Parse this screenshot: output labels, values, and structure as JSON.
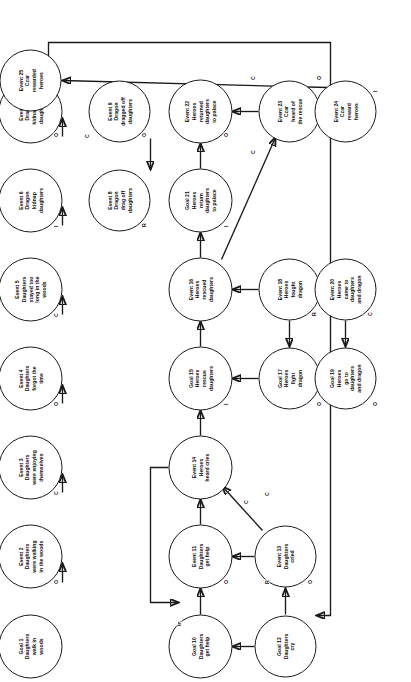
{
  "diagram": {
    "orientation": "rotated-90-ccw",
    "node_shape": "circle",
    "colors": {
      "stroke": "#1a1a1a",
      "fill": "#ffffff",
      "text": "#0d0d0d"
    },
    "edge_label_legend": {
      "O": "Outcome",
      "C": "Cause / Consequence",
      "R": "Reason",
      "I": "Initiate",
      "In": "Initiate (long-range)"
    }
  },
  "nodes": [
    {
      "id": 1,
      "label": "Goal 1\nDaughters\nwalk in\nwoods",
      "x": 36,
      "y": 30,
      "d": 64
    },
    {
      "id": 2,
      "label": "Event 2\nDaughters\nwere walking\nin the woods",
      "x": 126,
      "y": 30,
      "d": 64
    },
    {
      "id": 3,
      "label": "Event 3\nDaughters\nwere enjoying\nthemselves",
      "x": 215,
      "y": 30,
      "d": 64
    },
    {
      "id": 4,
      "label": "Event 4\nDaughters\nforgot the\ntime",
      "x": 304,
      "y": 30,
      "d": 64
    },
    {
      "id": 5,
      "label": "Event 5\nDaughters\nstayed too\nlong in the\nwoods",
      "x": 393,
      "y": 30,
      "d": 64
    },
    {
      "id": 6,
      "label": "Event 6\nDragon\nkidnap\ndaughters",
      "x": 482,
      "y": 30,
      "d": 64
    },
    {
      "id": 7,
      "label": "Event 7\nDragon\nkidnapped\ndaughters",
      "x": 571,
      "y": 30,
      "d": 64
    },
    {
      "id": 8,
      "label": "Event 8\nDragon\ndrag off\ndaughters",
      "x": 482,
      "y": 119,
      "d": 62
    },
    {
      "id": 9,
      "label": "Event 9\nDragon\ndragged off\ndaughters",
      "x": 571,
      "y": 119,
      "d": 62
    },
    {
      "id": 10,
      "label": "Goal 10\nDaughters\nget help",
      "x": 36,
      "y": 200,
      "d": 64
    },
    {
      "id": 11,
      "label": "Event 11\nDaughters\nget help",
      "x": 126,
      "y": 200,
      "d": 64
    },
    {
      "id": 12,
      "label": "Goal 12\nDaughters\ncry",
      "x": 36,
      "y": 285,
      "d": 62
    },
    {
      "id": 13,
      "label": "Event 13\nDaughters\ncried",
      "x": 126,
      "y": 285,
      "d": 62
    },
    {
      "id": 14,
      "label": "Event 14\nHeroes\nheard cries",
      "x": 215,
      "y": 200,
      "d": 64
    },
    {
      "id": 15,
      "label": "Goal 15\nHeroes\nrescue\ndaughters",
      "x": 304,
      "y": 200,
      "d": 64
    },
    {
      "id": 16,
      "label": "Event 16\nHeroes\nrescued\ndaughters",
      "x": 393,
      "y": 200,
      "d": 64
    },
    {
      "id": 17,
      "label": "Goal 17\nHeroes\nfight\ndragon",
      "x": 304,
      "y": 289,
      "d": 62
    },
    {
      "id": 18,
      "label": "Event 18\nHeroes\nfought\ndragon",
      "x": 393,
      "y": 289,
      "d": 62
    },
    {
      "id": 19,
      "label": "Goal 19\nHeroes\ngo to\ndaughters\nand dragon",
      "x": 304,
      "y": 345,
      "d": 62
    },
    {
      "id": 20,
      "label": "Event 20\nHeroes\ncame to\ndaughters\nand dragon",
      "x": 393,
      "y": 345,
      "d": 62
    },
    {
      "id": 21,
      "label": "Goal 21\nHeroes\nreturn\ndaughters\nto palace",
      "x": 482,
      "y": 200,
      "d": 64
    },
    {
      "id": 22,
      "label": "Event 22\nHeroes\nreturned\ndaughters\nto palace",
      "x": 571,
      "y": 200,
      "d": 64
    },
    {
      "id": 23,
      "label": "Event 23\nCzar\nheard of\nthe rescue",
      "x": 571,
      "y": 289,
      "d": 62
    },
    {
      "id": 24,
      "label": "Event 24\nCzar\nreward\nheroes",
      "x": 571,
      "y": 345,
      "d": 62
    },
    {
      "id": 25,
      "label": "Event 25\nCzar\nrewarded\nheroes",
      "x": 602,
      "y": 30,
      "d": 62
    }
  ],
  "edge_labels": [
    {
      "text": "O",
      "x": 98,
      "y": 53
    },
    {
      "text": "C",
      "x": 187,
      "y": 53
    },
    {
      "text": "O",
      "x": 276,
      "y": 53
    },
    {
      "text": "C",
      "x": 365,
      "y": 53
    },
    {
      "text": "I",
      "x": 455,
      "y": 53
    },
    {
      "text": "O",
      "x": 545,
      "y": 53
    },
    {
      "text": "R",
      "x": 455,
      "y": 141
    },
    {
      "text": "O",
      "x": 545,
      "y": 141
    },
    {
      "text": "C",
      "x": 544,
      "y": 84
    },
    {
      "text": "O",
      "x": 98,
      "y": 223
    },
    {
      "text": "O",
      "x": 98,
      "y": 307
    },
    {
      "text": "R",
      "x": 98,
      "y": 264
    },
    {
      "text": "C",
      "x": 186,
      "y": 264
    },
    {
      "text": "C",
      "x": 178,
      "y": 243
    },
    {
      "text": "In",
      "x": 56,
      "y": 176
    },
    {
      "text": "I",
      "x": 277,
      "y": 223
    },
    {
      "text": "O",
      "x": 276,
      "y": 316
    },
    {
      "text": "O",
      "x": 276,
      "y": 372
    },
    {
      "text": "R",
      "x": 366,
      "y": 311
    },
    {
      "text": "C",
      "x": 366,
      "y": 367
    },
    {
      "text": "I",
      "x": 455,
      "y": 223
    },
    {
      "text": "O",
      "x": 545,
      "y": 223
    },
    {
      "text": "C",
      "x": 528,
      "y": 250
    },
    {
      "text": "C",
      "x": 602,
      "y": 250
    },
    {
      "text": "O",
      "x": 602,
      "y": 316
    },
    {
      "text": "I",
      "x": 590,
      "y": 372
    }
  ]
}
